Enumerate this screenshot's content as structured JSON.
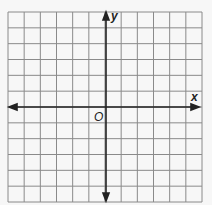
{
  "diagram": {
    "type": "coordinate-plane",
    "grid": {
      "columns": 12,
      "rows": 12,
      "line_color": "#8a8a8a",
      "background": "#f7f7f7"
    },
    "axes": {
      "x_label": "x",
      "y_label": "y",
      "origin_label": "O",
      "axis_color": "#222222"
    }
  }
}
